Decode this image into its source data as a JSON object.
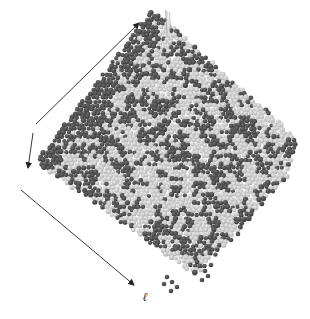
{
  "figure": {
    "axis_label": "ℓ",
    "background_color": "#ffffff",
    "arrow_color": "#222222",
    "label_color": "#333333",
    "box_edge_line_color": "#949494",
    "box_edge_highlight_color": "#e0e0e0",
    "sphere_colors": {
      "dark_highlight": "#6e6e6e",
      "dark_base": "#4a4a4a",
      "dark_edge": "#383838",
      "light_highlight": "#e8e8e8",
      "light_base": "#c6c6c6",
      "light_edge": "#a8a8a8"
    },
    "dark_fraction_front_face": 0.47,
    "dark_fraction_side_face": 0.93
  }
}
